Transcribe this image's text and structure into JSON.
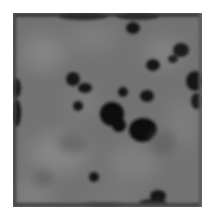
{
  "image": {
    "description": "Grayscale noise/texture image with dark irregular blobs",
    "colors": {
      "background": "#ffffff",
      "base_gray": "#717171",
      "light_gray": "#828282",
      "dark_blob": "#121212"
    }
  }
}
